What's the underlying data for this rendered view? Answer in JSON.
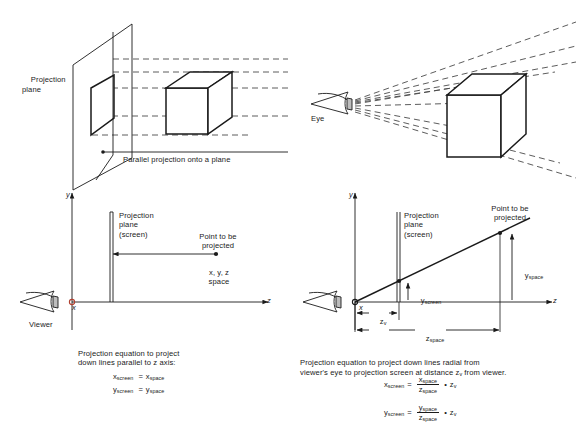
{
  "figure": {
    "background_color": "#ffffff",
    "ink_color": "#1a1a1a"
  },
  "panels": {
    "top_left": {
      "name": "parallel-projection-3d",
      "projection_plane_label": "Projection\nplane",
      "caption": "Parallel projection onto a plane",
      "objects": [
        "projection-plane",
        "projected-face",
        "cube",
        "parallel-rays"
      ],
      "ray_count": 5
    },
    "top_right": {
      "name": "perspective-projection-3d",
      "eye_label": "Eye",
      "objects": [
        "eye",
        "radial-rays",
        "cube"
      ],
      "ray_count": 8
    },
    "bottom_left": {
      "name": "parallel-projection-2d",
      "y_axis_label": "y",
      "z_axis_label": "z",
      "x_axis_label": "x",
      "viewer_label": "Viewer",
      "screen_label": "Projection\nplane\n(screen)",
      "point_label": "Point to be\nprojected",
      "space_label": "x, y, z\nspace",
      "caption": "Projection equation to project\ndown lines parallel to z axis:",
      "equations": [
        {
          "lhs": "x",
          "lhs_sub": "screen",
          "rel": "=",
          "rhs": "x",
          "rhs_sub": "space"
        },
        {
          "lhs": "y",
          "lhs_sub": "screen",
          "rel": "=",
          "rhs": "y",
          "rhs_sub": "space"
        }
      ]
    },
    "bottom_right": {
      "name": "perspective-projection-2d",
      "y_axis_label": "y",
      "z_axis_label": "z",
      "x_axis_label": "x",
      "screen_label": "Projection\nplane\n(screen)",
      "point_label": "Point to be\nprojected",
      "y_space_label": "y",
      "y_space_sub": "space",
      "y_screen_label": "y",
      "y_screen_sub": "screen",
      "z_v_label": "z",
      "z_v_sub": "v",
      "z_space_label": "z",
      "z_space_sub": "space",
      "caption": "Projection equation to project down lines radial from\nviewer's eye to projection screen at distance z",
      "caption_sub": "v",
      "caption_tail": " from viewer.",
      "equations": [
        {
          "lhs": "x",
          "lhs_sub": "screen",
          "rel": "=",
          "num": "x",
          "num_sub": "space",
          "den": "z",
          "den_sub": "space",
          "op": "•",
          "factor": "z",
          "factor_sub": "v"
        },
        {
          "lhs": "y",
          "lhs_sub": "screen",
          "rel": "=",
          "num": "y",
          "num_sub": "space",
          "den": "z",
          "den_sub": "space",
          "op": "•",
          "factor": "z",
          "factor_sub": "v"
        }
      ]
    }
  }
}
